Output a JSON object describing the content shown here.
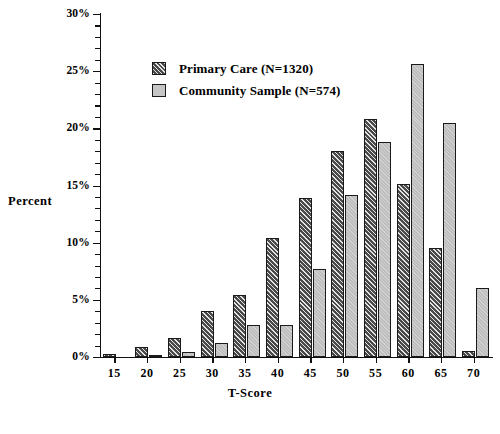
{
  "chart_data": {
    "type": "bar",
    "title": "",
    "xlabel": "T-Score",
    "ylabel": "Percent",
    "categories": [
      "15",
      "20",
      "25",
      "30",
      "35",
      "40",
      "45",
      "50",
      "55",
      "60",
      "65",
      "70"
    ],
    "ylim": [
      0,
      30
    ],
    "ytick_labels": [
      "0%",
      "5%",
      "10%",
      "15%",
      "20%",
      "25%",
      "30%"
    ],
    "ytick_values": [
      0,
      5,
      10,
      15,
      20,
      25,
      30
    ],
    "grid": false,
    "legend_position": "upper-left-inside",
    "series": [
      {
        "name": "Primary Care (N=1320)",
        "n": 1320,
        "fill": "dark-hatched",
        "color": "#4a4a4a",
        "values": [
          0.3,
          0.9,
          1.7,
          4.0,
          5.4,
          10.4,
          13.9,
          18.0,
          20.8,
          15.1,
          9.5,
          0.5
        ]
      },
      {
        "name": "Community Sample (N=574)",
        "n": 574,
        "fill": "light-gray",
        "color": "#bdbdbd",
        "values": [
          0.0,
          0.2,
          0.4,
          1.2,
          2.8,
          2.8,
          7.7,
          14.2,
          18.8,
          25.6,
          20.5,
          6.0
        ]
      }
    ]
  },
  "axes": {
    "y_label": "Percent",
    "x_label": "T-Score"
  },
  "legend": {
    "items": [
      {
        "label": "Primary Care (N=1320)",
        "swatch": "dark-hatched-swatch"
      },
      {
        "label": "Community Sample (N=574)",
        "swatch": "light-gray-swatch"
      }
    ]
  },
  "colors": {
    "primary_series": "#4a4a4a",
    "community_series": "#bdbdbd",
    "axis": "#111111",
    "background": "#ffffff"
  }
}
